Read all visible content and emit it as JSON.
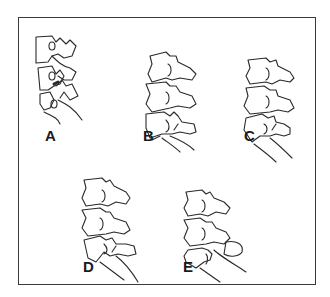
{
  "figure": {
    "panels": [
      {
        "id": "A",
        "label": "A",
        "description": "lateral view of lumbar vertebrae with facet joints, dark contact at facet"
      },
      {
        "id": "B",
        "label": "B",
        "description": "three vertebrae lateral view, spondylolysis of lower vertebra"
      },
      {
        "id": "C",
        "label": "C",
        "description": "three vertebrae lateral view, pars defect at lowest level"
      },
      {
        "id": "D",
        "label": "D",
        "description": "three vertebrae lateral view, elongated pars / slip"
      },
      {
        "id": "E",
        "label": "E",
        "description": "three vertebrae lateral view, posterior element separation"
      }
    ],
    "colors": {
      "line": "#2a2a2a",
      "frame": "#3a3a3a",
      "background": "#ffffff"
    }
  }
}
